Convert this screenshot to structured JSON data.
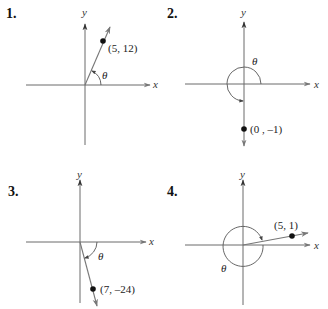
{
  "panels": [
    {
      "number": "1.",
      "x_label": "x",
      "y_label": "y",
      "angle_label": "θ",
      "point": {
        "x": 5,
        "y": 12,
        "label": "(5, 12)"
      },
      "quadrant": "I"
    },
    {
      "number": "2.",
      "x_label": "x",
      "y_label": "y",
      "angle_label": "θ",
      "point": {
        "x": 0,
        "y": -1,
        "label": "(0 , –1)"
      },
      "quadrant": "negative y-axis"
    },
    {
      "number": "3.",
      "x_label": "x",
      "y_label": "y",
      "angle_label": "θ",
      "point": {
        "x": 7,
        "y": -24,
        "label": "(7, –24)"
      },
      "quadrant": "IV"
    },
    {
      "number": "4.",
      "x_label": "x",
      "y_label": "y",
      "angle_label": "θ",
      "point": {
        "x": 5,
        "y": 1,
        "label": "(5, 1)"
      },
      "quadrant": "I"
    }
  ],
  "colors": {
    "axis": "#6a6a6a",
    "text": "#222222",
    "point": "#111111"
  }
}
